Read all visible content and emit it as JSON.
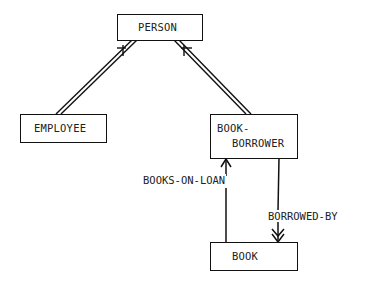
{
  "diagram": {
    "type": "entity-relationship",
    "nodes": [
      {
        "id": "person",
        "label": "PERSON"
      },
      {
        "id": "employee",
        "label": "EMPLOYEE"
      },
      {
        "id": "book_borrower",
        "label_line1": "BOOK-",
        "label_line2": "BORROWER"
      },
      {
        "id": "book",
        "label": "BOOK"
      }
    ],
    "edges": [
      {
        "from": "employee",
        "to": "person",
        "kind": "is-a (double line)"
      },
      {
        "from": "book_borrower",
        "to": "person",
        "kind": "is-a (double line)"
      },
      {
        "from": "book",
        "to": "book_borrower",
        "label": "BOOKS-ON-LOAN",
        "kind": "single arrow"
      },
      {
        "from": "book_borrower",
        "to": "book",
        "label": "BORROWED-BY",
        "kind": "double arrowhead (many)"
      }
    ],
    "colors": {
      "ink": "#111111",
      "background": "#ffffff"
    }
  }
}
